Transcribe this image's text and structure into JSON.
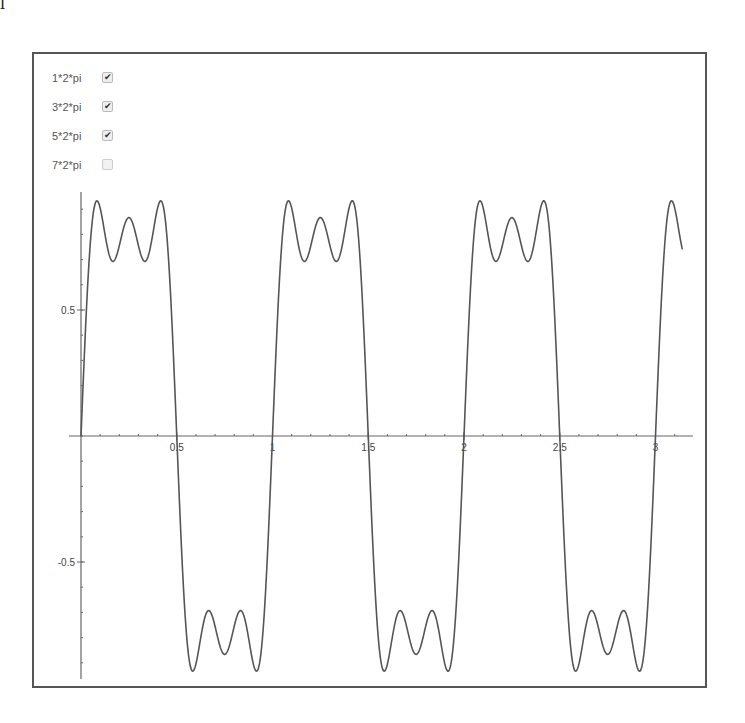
{
  "corner_mark": "l",
  "legend": {
    "items": [
      {
        "label": "1*2*pi",
        "checked": true
      },
      {
        "label": "3*2*pi",
        "checked": true
      },
      {
        "label": "5*2*pi",
        "checked": true
      },
      {
        "label": "7*2*pi",
        "checked": false
      }
    ]
  },
  "colors": {
    "curve": "#555555",
    "axis": "#666666",
    "frame": "#555555"
  },
  "chart_data": {
    "type": "line",
    "title": "",
    "xlabel": "",
    "ylabel": "",
    "function": "sin(2*pi*x) + sin(3*2*pi*x)/3 + sin(5*2*pi*x)/5",
    "terms": [
      1,
      3,
      5
    ],
    "xlim": [
      0,
      3.14
    ],
    "ylim": [
      -0.96,
      0.97
    ],
    "x_ticks": [
      {
        "value": 0.5,
        "label": "0.5"
      },
      {
        "value": 1,
        "label": "1"
      },
      {
        "value": 1.5,
        "label": "1.5"
      },
      {
        "value": 2,
        "label": "2"
      },
      {
        "value": 2.5,
        "label": "2.5"
      },
      {
        "value": 3,
        "label": "3"
      }
    ],
    "y_ticks": [
      {
        "value": 0.5,
        "label": "0.5"
      },
      {
        "value": -0.5,
        "label": "-0.5"
      }
    ],
    "legend_position": "top-left",
    "grid": false,
    "series": [
      {
        "name": "1*2*pi + 3*2*pi + 5*2*pi",
        "sample_points": [
          {
            "x": 0,
            "y": 0
          },
          {
            "x": 0.04,
            "y": 0.93
          },
          {
            "x": 0.083,
            "y": 0.69
          },
          {
            "x": 0.125,
            "y": 0.87
          },
          {
            "x": 0.167,
            "y": 0.69
          },
          {
            "x": 0.21,
            "y": 0.93
          },
          {
            "x": 0.5,
            "y": 0
          },
          {
            "x": 0.75,
            "y": -0.87
          },
          {
            "x": 1,
            "y": 0
          },
          {
            "x": 1.25,
            "y": 0.87
          },
          {
            "x": 1.5,
            "y": 0
          },
          {
            "x": 2,
            "y": 0
          },
          {
            "x": 2.5,
            "y": 0
          },
          {
            "x": 3,
            "y": 0
          },
          {
            "x": 3.14,
            "y": 0.72
          }
        ]
      }
    ]
  },
  "layout": {
    "origin_px": [
      81,
      436
    ],
    "px_per_x": 191.5,
    "px_per_y": 252,
    "x_axis_end_px": 693,
    "y_axis_top_px": 192,
    "y_axis_bottom_px": 679
  }
}
